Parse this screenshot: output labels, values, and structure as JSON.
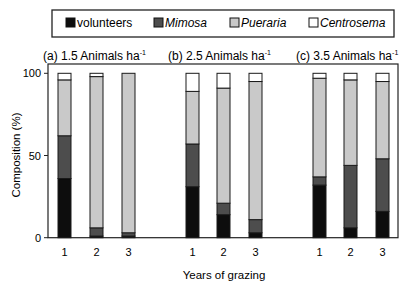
{
  "chart_data": {
    "type": "bar",
    "stacked": true,
    "title": "",
    "xlabel": "Years of grazing",
    "ylabel": "Composition (%)",
    "ylim": [
      0,
      105
    ],
    "yticks": [
      0,
      50,
      100
    ],
    "grid": false,
    "legend_position": "top",
    "legend": [
      {
        "name": "volunteers",
        "italic": false,
        "color": "#0d0d0d"
      },
      {
        "name": "Mimosa",
        "italic": true,
        "color": "#4d4d4d"
      },
      {
        "name": "Pueraria",
        "italic": true,
        "color": "#c9c9c9"
      },
      {
        "name": "Centrosema",
        "italic": true,
        "color": "#ffffff"
      }
    ],
    "panels": [
      {
        "label": "(a) 1.5 Animals ha",
        "superscript": "-1",
        "categories": [
          "1",
          "2",
          "3"
        ],
        "series": [
          {
            "name": "volunteers",
            "values": [
              36,
              1,
              1
            ]
          },
          {
            "name": "Mimosa",
            "values": [
              26,
              5,
              2
            ]
          },
          {
            "name": "Pueraria",
            "values": [
              34,
              92,
              97
            ]
          },
          {
            "name": "Centrosema",
            "values": [
              4,
              2,
              0
            ]
          }
        ]
      },
      {
        "label": "(b) 2.5 Animals ha",
        "superscript": "-1",
        "categories": [
          "1",
          "2",
          "3"
        ],
        "series": [
          {
            "name": "volunteers",
            "values": [
              31,
              14,
              3
            ]
          },
          {
            "name": "Mimosa",
            "values": [
              26,
              7,
              8
            ]
          },
          {
            "name": "Pueraria",
            "values": [
              32,
              70,
              84
            ]
          },
          {
            "name": "Centrosema",
            "values": [
              11,
              9,
              5
            ]
          }
        ]
      },
      {
        "label": "(c) 3.5 Animals ha",
        "superscript": "-1",
        "categories": [
          "1",
          "2",
          "3"
        ],
        "series": [
          {
            "name": "volunteers",
            "values": [
              32,
              6,
              16
            ]
          },
          {
            "name": "Mimosa",
            "values": [
              5,
              38,
              32
            ]
          },
          {
            "name": "Pueraria",
            "values": [
              60,
              52,
              47
            ]
          },
          {
            "name": "Centrosema",
            "values": [
              3,
              4,
              5
            ]
          }
        ]
      }
    ]
  }
}
